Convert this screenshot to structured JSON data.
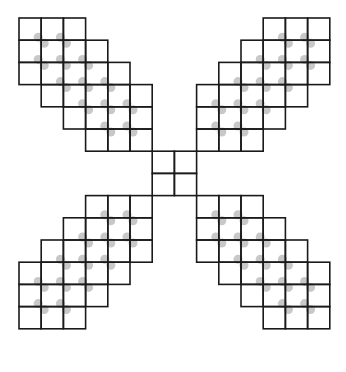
{
  "diagram": {
    "cell_size": 22.2,
    "line_color": "#1a1a1a",
    "dot_color": "#c8c8c8",
    "origin": {
      "x": 19,
      "y": 18
    },
    "center_block": {
      "col": 6,
      "row": 6,
      "size": 2
    },
    "arms": [
      {
        "name": "top-left",
        "rows": [
          [
            0,
            3
          ],
          [
            0,
            4
          ],
          [
            0,
            5
          ],
          [
            1,
            6
          ],
          [
            2,
            6
          ],
          [
            3,
            6
          ]
        ],
        "row_offset": 0
      },
      {
        "name": "top-right",
        "mirror": "x"
      },
      {
        "name": "bottom-left",
        "mirror": "y"
      },
      {
        "name": "bottom-right",
        "mirror": "xy"
      }
    ],
    "dots_top_left": [
      [
        1,
        1
      ],
      [
        2,
        1
      ],
      [
        1,
        2
      ],
      [
        2,
        2
      ],
      [
        3,
        2
      ],
      [
        2,
        3
      ],
      [
        3,
        3
      ],
      [
        4,
        3
      ],
      [
        3,
        4
      ],
      [
        4,
        4
      ],
      [
        5,
        4
      ],
      [
        4,
        5
      ],
      [
        5,
        5
      ]
    ]
  }
}
